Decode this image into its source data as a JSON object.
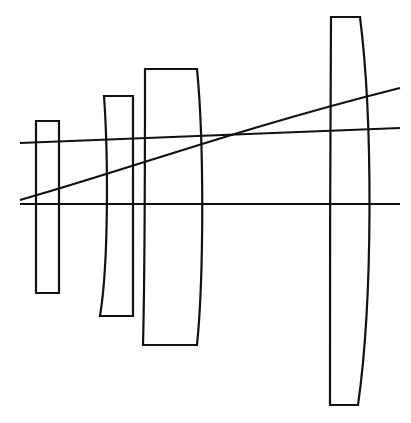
{
  "figure": {
    "kind": "optical-lens-cross-section",
    "title": "",
    "caption": "",
    "background_color": "#ffffff",
    "ink_color": "#000000",
    "width": 411,
    "height": 423
  },
  "diagram": {
    "stroke_color": "#111111",
    "fill_color": "#ffffff",
    "element_stroke_width": 2.2,
    "ray_stroke_width": 2.2,
    "axis_stroke_width": 2.0,
    "element_count": 4,
    "ray_count": 3
  },
  "elements": [
    {
      "index": 1,
      "name": "element-1-flat-plate",
      "shape": "flat-flat-plate",
      "left_x": 36,
      "right_x": 59,
      "top_y": 121,
      "bottom_y": 293,
      "thickness": 23,
      "height": 172,
      "path": "M 36 121 L 59 121 L 59 293 L 36 293 Z"
    },
    {
      "index": 2,
      "name": "element-2-meniscus",
      "shape": "meniscus-concave-left",
      "left_x": 100,
      "right_x": 133,
      "top_y": 96,
      "bottom_y": 316,
      "thickness": 33,
      "height": 220,
      "path": "M 104 96 L 133 96 L 133 316 L 100 316 C 109 262 108 152 104 96 Z"
    },
    {
      "index": 3,
      "name": "element-3-plano-convex",
      "shape": "plano-convex-right",
      "left_x": 143,
      "right_x": 198,
      "top_y": 69,
      "bottom_y": 345,
      "thickness": 55,
      "height": 276,
      "path": "M 145 69 L 197 69 C 204 140 204 275 197 345 L 143 345 C 145 270 145 140 145 69 Z"
    },
    {
      "index": 4,
      "name": "element-4-large-plano-convex",
      "shape": "plano-convex-right",
      "left_x": 329,
      "right_x": 368,
      "top_y": 17,
      "bottom_y": 405,
      "thickness": 39,
      "height": 388,
      "path": "M 331 17 L 360 17 C 373 120 373 300 358 405 L 330 405 C 330 280 330 140 331 17 Z"
    }
  ],
  "rays": [
    {
      "index": 1,
      "name": "upper-marginal-ray",
      "type": "near-horizontal",
      "start_x": 20,
      "start_y": 143,
      "end_x": 400,
      "end_y": 128,
      "path": "M 20 143 L 400 128"
    },
    {
      "index": 2,
      "name": "optical-axis",
      "type": "horizontal",
      "start_x": 20,
      "start_y": 204,
      "end_x": 400,
      "end_y": 204,
      "path": "M 20 204 L 400 204"
    },
    {
      "index": 3,
      "name": "oblique-chief-ray",
      "type": "diagonal-rising",
      "start_x": 20,
      "start_y": 200,
      "end_x": 400,
      "end_y": 88,
      "path": "M 20 200 C 120 172 240 128 400 88"
    }
  ]
}
